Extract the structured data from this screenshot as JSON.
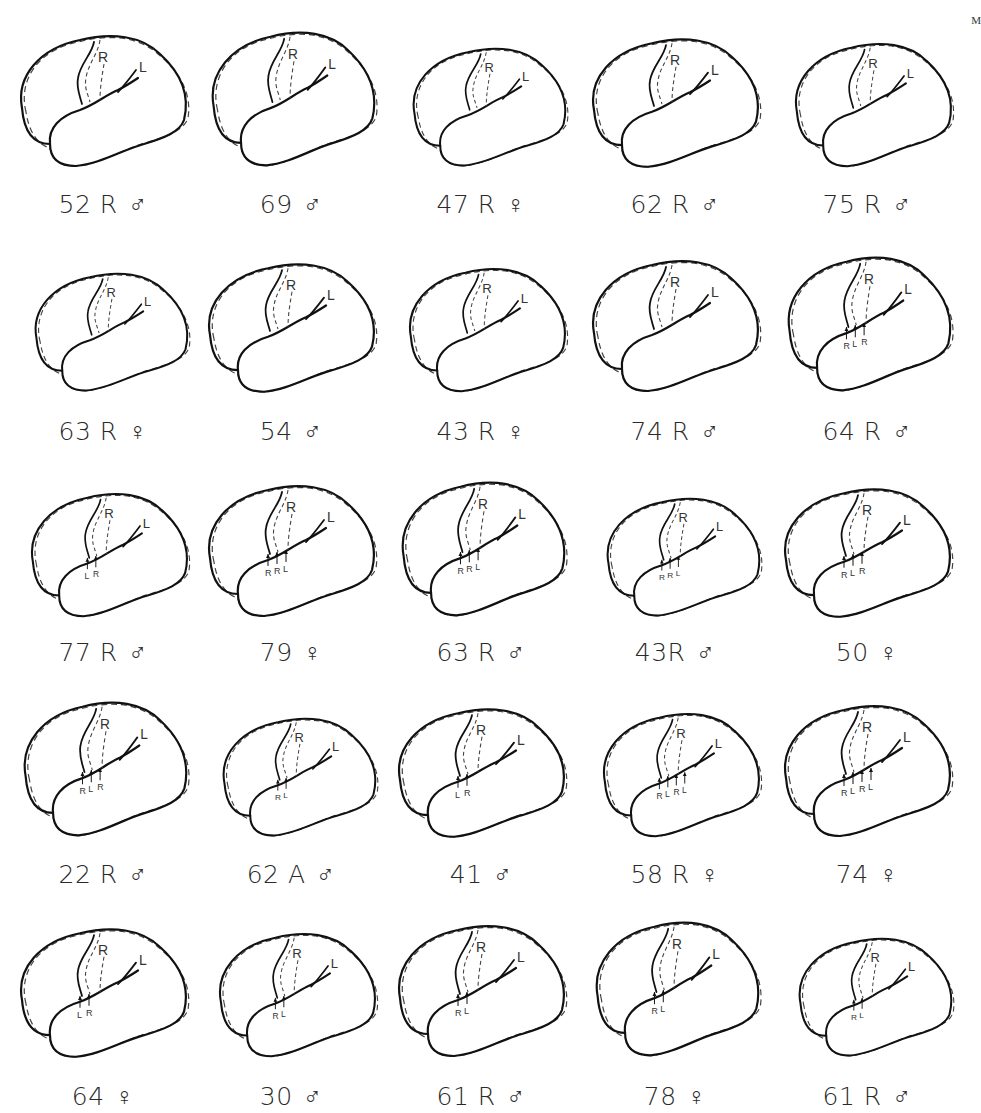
{
  "figure": {
    "legend": {
      "solid_line": "left hemisphere",
      "dashed_line": "right hemisphere",
      "marker_R": "R",
      "marker_L": "L"
    },
    "corner_mark": "M",
    "symbols": {
      "male": "♂",
      "female": "♀"
    },
    "rows": [
      {
        "cells": [
          {
            "age": "52",
            "hand": "R",
            "sex": "male",
            "caption": "52 R",
            "markers": [
              "R",
              "L"
            ],
            "sylvian_arrows": []
          },
          {
            "age": "69",
            "hand": "",
            "sex": "male",
            "caption": "69",
            "markers": [
              "R",
              "L"
            ],
            "sylvian_arrows": []
          },
          {
            "age": "47",
            "hand": "R",
            "sex": "female",
            "caption": "47 R",
            "markers": [
              "R",
              "L"
            ],
            "sylvian_arrows": []
          },
          {
            "age": "62",
            "hand": "R",
            "sex": "male",
            "caption": "62 R",
            "markers": [
              "R",
              "L"
            ],
            "sylvian_arrows": []
          },
          {
            "age": "75",
            "hand": "R",
            "sex": "male",
            "caption": "75 R",
            "markers": [
              "R",
              "L"
            ],
            "sylvian_arrows": []
          }
        ]
      },
      {
        "cells": [
          {
            "age": "63",
            "hand": "R",
            "sex": "female",
            "caption": "63 R",
            "markers": [
              "R",
              "L"
            ],
            "sylvian_arrows": []
          },
          {
            "age": "54",
            "hand": "",
            "sex": "male",
            "caption": "54",
            "markers": [
              "R",
              "L"
            ],
            "sylvian_arrows": []
          },
          {
            "age": "43",
            "hand": "R",
            "sex": "female",
            "caption": "43 R",
            "markers": [
              "R",
              "L"
            ],
            "sylvian_arrows": []
          },
          {
            "age": "74",
            "hand": "R",
            "sex": "male",
            "caption": "74 R",
            "markers": [
              "R",
              "L"
            ],
            "sylvian_arrows": []
          },
          {
            "age": "64",
            "hand": "R",
            "sex": "male",
            "caption": "64 R",
            "markers": [
              "R",
              "L"
            ],
            "sylvian_arrows": [
              "R",
              "L",
              "R"
            ]
          }
        ]
      },
      {
        "cells": [
          {
            "age": "77",
            "hand": "R",
            "sex": "male",
            "caption": "77 R",
            "markers": [
              "R",
              "L"
            ],
            "sylvian_arrows": [
              "L",
              "R"
            ]
          },
          {
            "age": "79",
            "hand": "",
            "sex": "female",
            "caption": "79",
            "markers": [
              "R",
              "L"
            ],
            "sylvian_arrows": [
              "R",
              "R",
              "L"
            ]
          },
          {
            "age": "63",
            "hand": "R",
            "sex": "male",
            "caption": "63 R",
            "markers": [
              "R",
              "L"
            ],
            "sylvian_arrows": [
              "R",
              "R",
              "L"
            ]
          },
          {
            "age": "43",
            "hand": "R",
            "sex": "male",
            "caption": "43R",
            "markers": [
              "R",
              "L"
            ],
            "sylvian_arrows": [
              "R",
              "R",
              "L"
            ]
          },
          {
            "age": "50",
            "hand": "",
            "sex": "female",
            "caption": "50",
            "markers": [
              "R",
              "L"
            ],
            "sylvian_arrows": [
              "R",
              "L",
              "R"
            ]
          }
        ]
      },
      {
        "cells": [
          {
            "age": "22",
            "hand": "R",
            "sex": "male",
            "caption": "22 R",
            "markers": [
              "R",
              "L"
            ],
            "sylvian_arrows": [
              "R",
              "L",
              "R"
            ]
          },
          {
            "age": "62",
            "hand": "A",
            "sex": "male",
            "caption": "62 A",
            "markers": [
              "R",
              "L"
            ],
            "sylvian_arrows": [
              "R",
              "L"
            ]
          },
          {
            "age": "41",
            "hand": "",
            "sex": "male",
            "caption": "41",
            "markers": [
              "R",
              "L"
            ],
            "sylvian_arrows": [
              "L",
              "R"
            ]
          },
          {
            "age": "58",
            "hand": "R",
            "sex": "female",
            "caption": "58 R",
            "markers": [
              "R",
              "L"
            ],
            "sylvian_arrows": [
              "R",
              "L",
              "R",
              "L"
            ]
          },
          {
            "age": "74",
            "hand": "",
            "sex": "female",
            "caption": "74",
            "markers": [
              "R",
              "L"
            ],
            "sylvian_arrows": [
              "R",
              "L",
              "R",
              "L"
            ]
          }
        ]
      },
      {
        "cells": [
          {
            "age": "64",
            "hand": "",
            "sex": "female",
            "caption": "64",
            "markers": [
              "R",
              "L"
            ],
            "sylvian_arrows": [
              "L",
              "R"
            ]
          },
          {
            "age": "30",
            "hand": "",
            "sex": "male",
            "caption": "30",
            "markers": [
              "R",
              "L"
            ],
            "sylvian_arrows": [
              "R",
              "L"
            ]
          },
          {
            "age": "61",
            "hand": "R",
            "sex": "male",
            "caption": "61 R",
            "markers": [
              "R",
              "L"
            ],
            "sylvian_arrows": [
              "R",
              "L"
            ]
          },
          {
            "age": "78",
            "hand": "",
            "sex": "female",
            "caption": "78",
            "markers": [
              "R",
              "L"
            ],
            "sylvian_arrows": [
              "R",
              "L"
            ]
          },
          {
            "age": "61",
            "hand": "R",
            "sex": "male",
            "caption": "61 R",
            "markers": [
              "R",
              "L"
            ],
            "sylvian_arrows": [
              "R",
              "L"
            ]
          }
        ]
      }
    ]
  }
}
